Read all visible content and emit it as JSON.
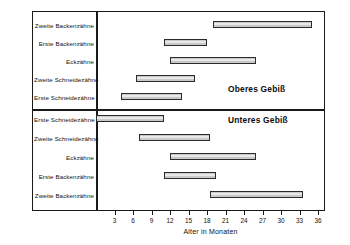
{
  "chart_data": {
    "type": "bar",
    "orientation": "horizontal",
    "subtype": "range-bar",
    "title": "",
    "xlabel": "Alter in Monaten",
    "ylabel": "",
    "xlim": [
      0,
      36
    ],
    "xticks": [
      3,
      6,
      9,
      12,
      15,
      18,
      21,
      24,
      27,
      30,
      33,
      36
    ],
    "grid": false,
    "legend": false,
    "panels": [
      {
        "caption": "Oberes Gebiß",
        "categories": [
          "Zweite Backenzähne",
          "Erste Backenzähne",
          "Eckzähne",
          "Zweite Schneidezähne",
          "Erste Schneidezähne"
        ],
        "ranges": [
          [
            19,
            35
          ],
          [
            11,
            18
          ],
          [
            12,
            26
          ],
          [
            6.5,
            16
          ],
          [
            4,
            14
          ]
        ]
      },
      {
        "caption": "Unteres Gebiß",
        "categories": [
          "Erste  Schneidezähne",
          "Zweite Schneidezähne",
          "Eckzähne",
          "Erste Backenzähne",
          "Zweite Backenzähne"
        ],
        "ranges": [
          [
            0,
            11
          ],
          [
            7,
            18.5
          ],
          [
            12,
            26
          ],
          [
            11,
            19.5
          ],
          [
            18.5,
            33.5
          ]
        ]
      }
    ]
  },
  "colors": {
    "bar_fill": "#c9c9c9",
    "bar_border": "#2b2b2b",
    "frame": "#1a1a1a",
    "text": "#111111",
    "background": "#ffffff"
  }
}
